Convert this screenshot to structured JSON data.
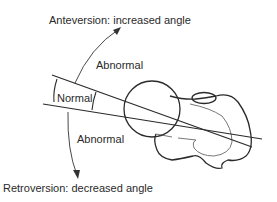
{
  "diagram": {
    "title_top": "Anteversion: increased angle",
    "title_bottom": "Retroversion: decreased angle",
    "region_normal": "Normal",
    "region_abnormal_upper": "Abnormal",
    "region_abnormal_lower": "Abnormal",
    "stroke_color": "#2a2a2a",
    "background": "#ffffff"
  }
}
